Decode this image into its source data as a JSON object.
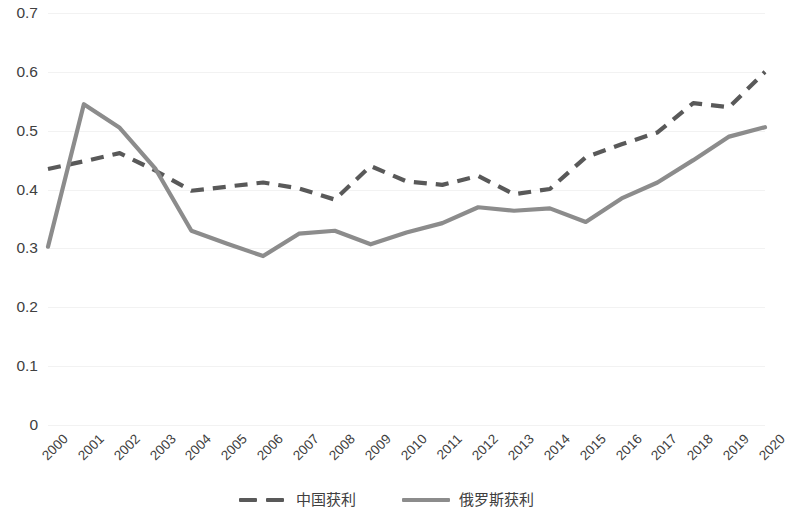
{
  "chart_data": {
    "type": "line",
    "title": "",
    "subtitle": "",
    "xlabel": "",
    "ylabel": "",
    "categories": [
      "2000",
      "2001",
      "2002",
      "2003",
      "2004",
      "2005",
      "2006",
      "2007",
      "2008",
      "2009",
      "2010",
      "2011",
      "2012",
      "2013",
      "2014",
      "2015",
      "2016",
      "2017",
      "2018",
      "2019",
      "2020"
    ],
    "x_tick_labels": [
      "2000",
      "2001",
      "2002",
      "2003",
      "2004",
      "2005",
      "2006",
      "2007",
      "2008",
      "2009",
      "2010",
      "2011",
      "2012",
      "2013",
      "2014",
      "2015",
      "2016",
      "2017",
      "2018",
      "2019",
      "2020"
    ],
    "y_tick_labels": [
      "0.7",
      "0.6",
      "0.5",
      "0.4",
      "0.3",
      "0.2",
      "0.1",
      "0"
    ],
    "y_tick_values": [
      0.7,
      0.6,
      0.5,
      0.4,
      0.3,
      0.2,
      0.1,
      0
    ],
    "ylim": [
      0,
      0.7
    ],
    "xlim": [
      "2000",
      "2020"
    ],
    "grid": true,
    "legend_position": "bottom",
    "series": [
      {
        "name": "中国获利",
        "style": "dashed",
        "color": "#595959",
        "values": [
          0.435,
          0.448,
          0.462,
          0.432,
          0.398,
          0.405,
          0.412,
          0.402,
          0.383,
          0.44,
          0.414,
          0.408,
          0.423,
          0.392,
          0.401,
          0.455,
          0.477,
          0.497,
          0.547,
          0.54,
          0.6
        ]
      },
      {
        "name": "俄罗斯获利",
        "style": "solid",
        "color": "#8c8c8c",
        "values": [
          0.303,
          0.545,
          0.505,
          0.435,
          0.33,
          0.308,
          0.287,
          0.325,
          0.33,
          0.307,
          0.327,
          0.343,
          0.37,
          0.364,
          0.368,
          0.345,
          0.385,
          0.412,
          0.45,
          0.49,
          0.506
        ]
      }
    ],
    "legend": [
      {
        "label": "中国获利",
        "style": "dashed",
        "color": "#595959"
      },
      {
        "label": "俄罗斯获利",
        "style": "solid",
        "color": "#8c8c8c"
      }
    ],
    "colors": {
      "gridline": "#f2f2f2",
      "text": "#404040",
      "background": "#ffffff",
      "china_series": "#595959",
      "russia_series": "#8c8c8c"
    }
  }
}
